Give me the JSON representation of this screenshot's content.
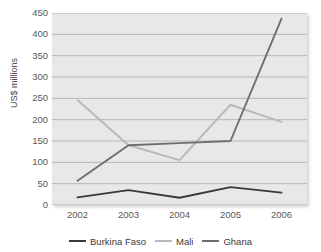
{
  "chart_data": {
    "type": "line",
    "title": "",
    "xlabel": "",
    "ylabel": "US$ millions",
    "categories": [
      "2002",
      "2003",
      "2004",
      "2005",
      "2006"
    ],
    "x": [
      2002,
      2003,
      2004,
      2005,
      2006
    ],
    "ylim": [
      0,
      450
    ],
    "yticks": [
      0,
      50,
      100,
      150,
      200,
      250,
      300,
      350,
      400,
      450
    ],
    "ytick_labels": [
      "0",
      "50",
      "100",
      "150",
      "200",
      "250",
      "300",
      "350",
      "400",
      "450"
    ],
    "grid": true,
    "legend_position": "bottom",
    "series": [
      {
        "name": "Burkina Faso",
        "color": "#3a3a3a",
        "values": [
          18,
          35,
          17,
          42,
          29
        ]
      },
      {
        "name": "Mali",
        "color": "#b9b9b9",
        "values": [
          246,
          140,
          105,
          235,
          195
        ]
      },
      {
        "name": "Ghana",
        "color": "#6e6e6e",
        "values": [
          57,
          140,
          145,
          150,
          437
        ]
      }
    ]
  },
  "colors": {
    "plot_background": "#e8e8e8",
    "gridline": "#a8a8a8",
    "axis": "#8f8f8f",
    "tick_text": "#5a5a5a"
  }
}
